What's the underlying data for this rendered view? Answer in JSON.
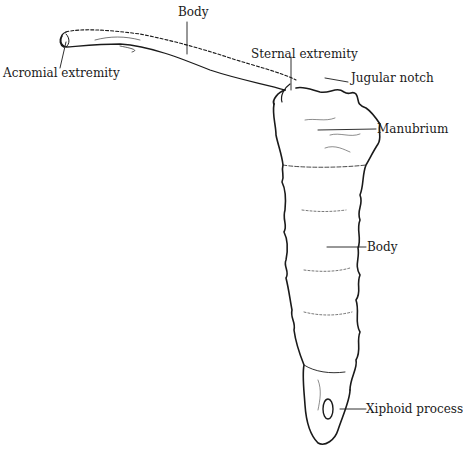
{
  "diagram": {
    "labels": {
      "clavicle_body": "Body",
      "acromial_extremity": "Acromial extremity",
      "sternal_extremity": "Sternal extremity",
      "jugular_notch": "Jugular notch",
      "manubrium": "Manubrium",
      "sternum_body": "Body",
      "xiphoid_process": "Xiphoid process"
    },
    "colors": {
      "ink": "#1a1a1a",
      "background": "#ffffff"
    }
  }
}
